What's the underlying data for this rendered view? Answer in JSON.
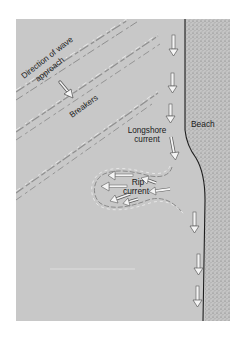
{
  "figure": {
    "colors": {
      "water": "#c8c8c8",
      "beach": "#b9b9b9",
      "shoreline": "#1e1e1e",
      "arrow_fill": "#f4f4f4",
      "arrow_stroke": "#5a5a5a",
      "wave_crest": "#eeeeee",
      "wave_shadow": "#8f8f8f",
      "background": "#ffffff"
    },
    "labels": {
      "wave_direction_line1": "Direction of wave",
      "wave_direction_line2": "approach",
      "breakers": "Breakers",
      "beach": "Beach",
      "longshore_line1": "Longshore",
      "longshore_line2": "current",
      "rip_line1": "Rip",
      "rip_line2": "current"
    }
  }
}
